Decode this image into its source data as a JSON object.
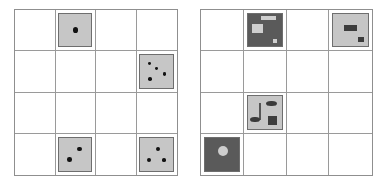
{
  "figure": {
    "title": "",
    "background_color": "#ffffff",
    "panel_count": 2,
    "grid_rows": 4,
    "grid_cols": 4,
    "grid_line_color": "#9a9a9a",
    "tile_light_color": "#c6c6c6",
    "tile_dark_color": "#5a5a5a",
    "dot_color": "#121212"
  },
  "panels": [
    {
      "name": "left-grid",
      "label": "",
      "tiles": [
        {
          "row": 1,
          "col": 2,
          "kind": "dice",
          "tile_color": "#c6c6c6",
          "pip_count": "1",
          "pips": [
            {
              "x": 50,
              "y": 50,
              "r": 17
            }
          ]
        },
        {
          "row": 2,
          "col": 4,
          "kind": "dice",
          "tile_color": "#c6c6c6",
          "pip_count": "4",
          "pips": [
            {
              "x": 28,
              "y": 26,
              "r": 11
            },
            {
              "x": 50,
              "y": 42,
              "r": 10
            },
            {
              "x": 74,
              "y": 58,
              "r": 10
            },
            {
              "x": 29,
              "y": 74,
              "r": 11
            }
          ]
        },
        {
          "row": 4,
          "col": 2,
          "kind": "dice",
          "tile_color": "#c6c6c6",
          "pip_count": "2",
          "pips": [
            {
              "x": 64,
              "y": 34,
              "r": 14
            },
            {
              "x": 32,
              "y": 66,
              "r": 14
            }
          ]
        },
        {
          "row": 4,
          "col": 4,
          "kind": "dice",
          "tile_color": "#c6c6c6",
          "pip_count": "3",
          "pips": [
            {
              "x": 54,
              "y": 33,
              "r": 12
            },
            {
              "x": 27,
              "y": 66,
              "r": 12
            },
            {
              "x": 72,
              "y": 66,
              "r": 11
            }
          ]
        }
      ]
    },
    {
      "name": "right-grid",
      "label": "",
      "tiles": [
        {
          "row": 1,
          "col": 2,
          "kind": "scene",
          "tile_color": "#5a5a5a",
          "shapes": [
            {
              "form": "rect",
              "tone": "light",
              "x": 38,
              "y": 8,
              "w": 46,
              "h": 12
            },
            {
              "form": "rect",
              "tone": "light",
              "x": 14,
              "y": 30,
              "w": 30,
              "h": 30
            },
            {
              "form": "rect",
              "tone": "light",
              "x": 74,
              "y": 76,
              "w": 14,
              "h": 13
            }
          ]
        },
        {
          "row": 1,
          "col": 4,
          "kind": "scene",
          "tile_color": "#c6c6c6",
          "shapes": [
            {
              "form": "rect",
              "tone": "dark",
              "x": 30,
              "y": 34,
              "w": 38,
              "h": 20
            },
            {
              "form": "rect",
              "tone": "dark",
              "x": 70,
              "y": 70,
              "w": 18,
              "h": 16
            }
          ]
        },
        {
          "row": 3,
          "col": 2,
          "kind": "scene",
          "tile_color": "#c6c6c6",
          "shapes": [
            {
              "form": "ellipse",
              "tone": "dark",
              "x": 54,
              "y": 13,
              "w": 34,
              "h": 18
            },
            {
              "form": "rod",
              "tone": "dark",
              "x": 33,
              "y": 22,
              "w": 7,
              "h": 52
            },
            {
              "form": "ellipse",
              "tone": "dark",
              "x": 6,
              "y": 62,
              "w": 30,
              "h": 18
            },
            {
              "form": "rect",
              "tone": "dark",
              "x": 60,
              "y": 60,
              "w": 28,
              "h": 28
            }
          ]
        },
        {
          "row": 4,
          "col": 1,
          "kind": "scene",
          "tile_color": "#5a5a5a",
          "shapes": [
            {
              "form": "circle",
              "tone": "light",
              "x": 38,
              "y": 24,
              "w": 30,
              "h": 30
            }
          ]
        }
      ]
    }
  ]
}
